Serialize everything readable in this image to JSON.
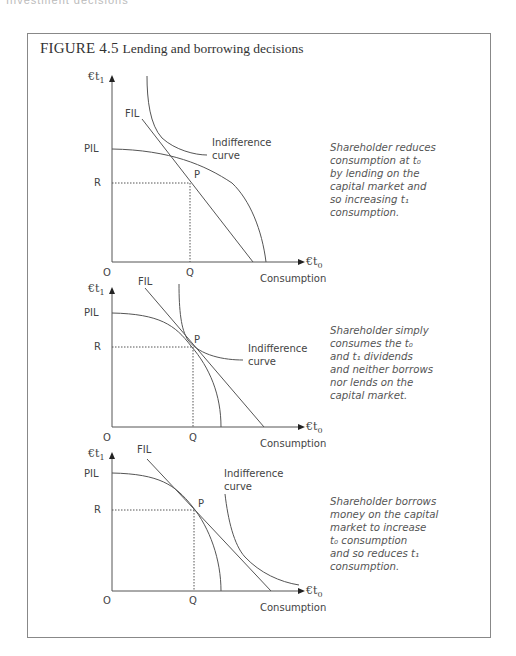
{
  "page_header": "Investment decisions",
  "figure": {
    "number": "FIGURE 4.5",
    "title": "Lending and borrowing decisions"
  },
  "panels": [
    {
      "y_axis_label": "€t",
      "y_axis_sub": "1",
      "x_axis_label": "€t",
      "x_axis_sub": "0",
      "x_axis_title": "Consumption",
      "origin": "O",
      "q_label": "Q",
      "r_label": "R",
      "pil_label": "PIL",
      "fil_label": "FIL",
      "p_label": "P",
      "indiff_line1": "Indifference",
      "indiff_line2": "curve",
      "caption": [
        "Shareholder reduces",
        "consumption at t₀",
        "by lending on the",
        "capital market and",
        "so increasing t₁",
        "consumption."
      ]
    },
    {
      "y_axis_label": "€t",
      "y_axis_sub": "1",
      "x_axis_label": "€t",
      "x_axis_sub": "0",
      "x_axis_title": "Consumption",
      "origin": "O",
      "q_label": "Q",
      "r_label": "R",
      "pil_label": "PIL",
      "fil_label": "FIL",
      "p_label": "P",
      "indiff_line1": "Indifference",
      "indiff_line2": "curve",
      "caption": [
        "Shareholder simply",
        "consumes the t₀",
        "and t₁ dividends",
        "and neither borrows",
        "nor lends on the",
        "capital market."
      ]
    },
    {
      "y_axis_label": "€t",
      "y_axis_sub": "1",
      "x_axis_label": "€t",
      "x_axis_sub": "0",
      "x_axis_title": "Consumption",
      "origin": "O",
      "q_label": "Q",
      "r_label": "R",
      "pil_label": "PIL",
      "fil_label": "FIL",
      "p_label": "P",
      "indiff_line1": "Indifference",
      "indiff_line2": "curve",
      "caption": [
        "Shareholder borrows",
        "money on the capital",
        "market to increase",
        "t₀ consumption",
        "and so reduces t₁",
        "consumption."
      ]
    }
  ],
  "colors": {
    "frame": "#888888",
    "line": "#555555",
    "text": "#444444",
    "caption": "#555555"
  }
}
